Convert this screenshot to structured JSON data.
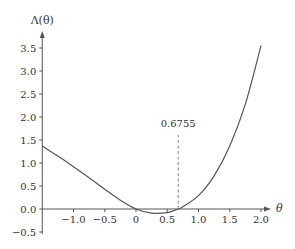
{
  "chart_data": {
    "type": "line",
    "title": "",
    "xlabel": "θ",
    "ylabel": "Λ(θ)",
    "xlim": [
      -1.5,
      2.15
    ],
    "ylim": [
      -0.5,
      3.8
    ],
    "grid": false,
    "x_ticks": [
      -1.0,
      -0.5,
      0,
      0.5,
      1.0,
      1.5,
      2.0
    ],
    "x_tick_labels": [
      "−1.0",
      "−0.5",
      "0",
      "0.5",
      "1.0",
      "1.5",
      "2.0"
    ],
    "y_ticks": [
      -0.5,
      0.0,
      0.5,
      1.0,
      1.5,
      2.0,
      2.5,
      3.0,
      3.5
    ],
    "y_tick_labels": [
      "−0.5",
      "0.0",
      "0.5",
      "1.0",
      "1.5",
      "2.0",
      "2.5",
      "3.0",
      "3.5"
    ],
    "series": [
      {
        "name": "Λ(θ)",
        "x": [
          -1.5,
          -1.25,
          -1.0,
          -0.75,
          -0.5,
          -0.25,
          0.0,
          0.25,
          0.5,
          0.6755,
          0.75,
          1.0,
          1.25,
          1.5,
          1.75,
          2.0
        ],
        "y": [
          1.37,
          1.15,
          0.92,
          0.68,
          0.43,
          0.19,
          0.0,
          -0.09,
          -0.08,
          0.0,
          0.05,
          0.29,
          0.72,
          1.37,
          2.28,
          3.55
        ]
      }
    ],
    "annotations": [
      {
        "type": "vline-dashed",
        "x": 0.6755,
        "y_from": 0.0,
        "y_to": 1.7,
        "label": "0.6755"
      }
    ],
    "colors": {
      "curve": "#555555",
      "axis": "#555555",
      "text": "#333333"
    }
  }
}
